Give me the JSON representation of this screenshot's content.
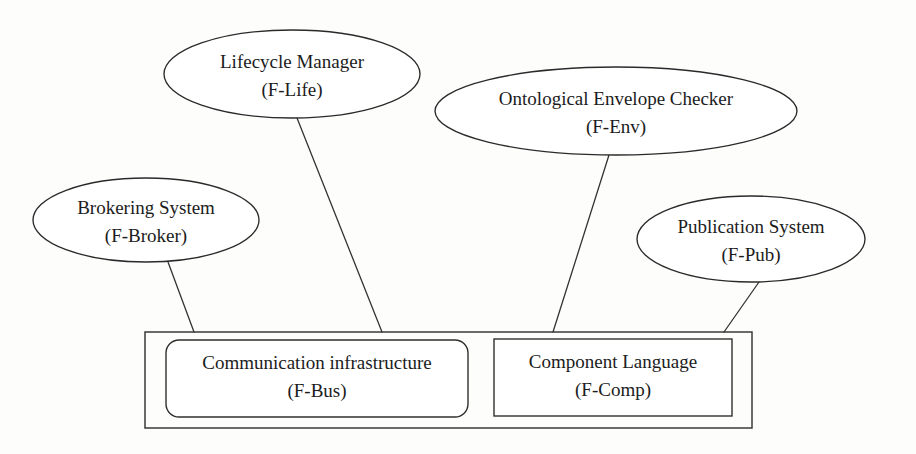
{
  "diagram": {
    "background_color": "#fdfdfc",
    "stroke_color": "#2a2a2a",
    "text_color": "#1c1c1c",
    "ellipse_nodes": [
      {
        "id": "f-life",
        "line1": "Lifecycle Manager",
        "line2": "(F-Life)",
        "cx": 292,
        "cy": 74,
        "rx": 128,
        "ry": 44
      },
      {
        "id": "f-env",
        "line1": "Ontological Envelope Checker",
        "line2": "(F-Env)",
        "cx": 616,
        "cy": 111,
        "rx": 181,
        "ry": 44
      },
      {
        "id": "f-broker",
        "line1": "Brokering System",
        "line2": "(F-Broker)",
        "cx": 146,
        "cy": 220,
        "rx": 113,
        "ry": 42
      },
      {
        "id": "f-pub",
        "line1": "Publication System",
        "line2": "(F-Pub)",
        "cx": 751,
        "cy": 239,
        "rx": 114,
        "ry": 43
      }
    ],
    "inner_boxes": [
      {
        "id": "f-bus",
        "line1": "Communication infrastructure",
        "line2": "(F-Bus)",
        "x": 166,
        "y": 340,
        "width": 302,
        "height": 77,
        "corner_radius": 13
      },
      {
        "id": "f-comp",
        "line1": "Component Language",
        "line2": "(F-Comp)",
        "x": 494,
        "y": 339,
        "width": 238,
        "height": 77,
        "corner_radius": 0
      }
    ],
    "outer_container": {
      "id": "framework-container",
      "x": 145,
      "y": 332,
      "width": 607,
      "height": 96
    },
    "connectors": [
      {
        "id": "f-broker-to-f-bus",
        "x1": 168,
        "y1": 262,
        "x2": 194,
        "y2": 332
      },
      {
        "id": "f-life-to-f-bus",
        "x1": 297,
        "y1": 118,
        "x2": 382,
        "y2": 332
      },
      {
        "id": "f-env-to-f-comp",
        "x1": 609,
        "y1": 155,
        "x2": 553,
        "y2": 332
      },
      {
        "id": "f-pub-to-f-comp",
        "x1": 759,
        "y1": 282,
        "x2": 724,
        "y2": 332
      }
    ]
  }
}
